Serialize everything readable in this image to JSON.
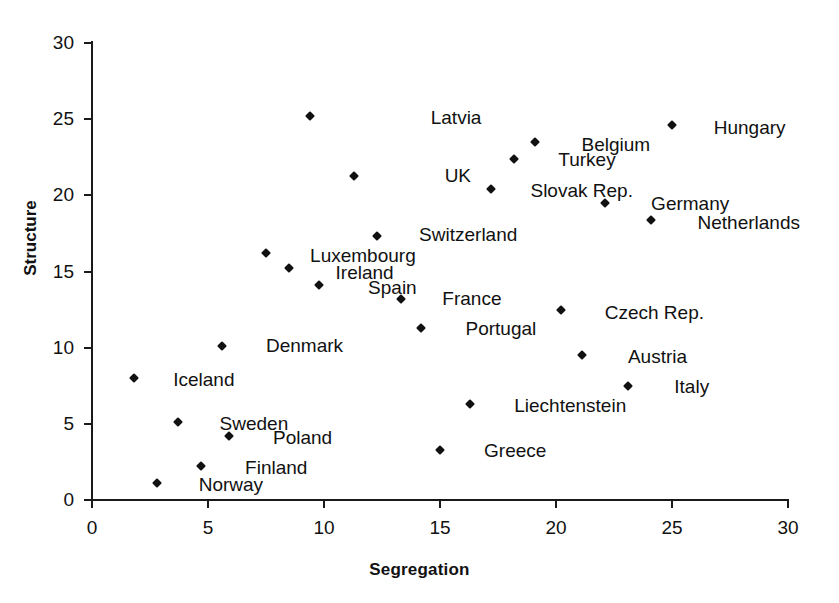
{
  "chart_data": {
    "type": "scatter",
    "title": "",
    "xlabel": "Segregation",
    "ylabel": "Structure",
    "xlim": [
      0,
      30
    ],
    "ylim": [
      0,
      30
    ],
    "xticks": [
      0,
      5,
      10,
      15,
      20,
      25,
      30
    ],
    "yticks": [
      0,
      5,
      10,
      15,
      20,
      25,
      30
    ],
    "grid": false,
    "legend": "none",
    "marker": "diamond",
    "marker_color": "#111111",
    "points": [
      {
        "label": "Latvia",
        "x": 9.4,
        "y": 25.2,
        "lx": 14.6,
        "ly": 25.1
      },
      {
        "label": "Hungary",
        "x": 25.0,
        "y": 24.6,
        "lx": 26.8,
        "ly": 24.4
      },
      {
        "label": "Belgium",
        "x": 19.1,
        "y": 23.5,
        "lx": 21.1,
        "ly": 23.3
      },
      {
        "label": "Turkey",
        "x": 18.2,
        "y": 22.4,
        "lx": 20.1,
        "ly": 22.3
      },
      {
        "label": "UK",
        "x": 11.3,
        "y": 21.3,
        "lx": 15.2,
        "ly": 21.3
      },
      {
        "label": "Slovak Rep.",
        "x": 17.2,
        "y": 20.4,
        "lx": 18.9,
        "ly": 20.3
      },
      {
        "label": "Germany",
        "x": 22.1,
        "y": 19.5,
        "lx": 24.1,
        "ly": 19.4
      },
      {
        "label": "Netherlands",
        "x": 24.1,
        "y": 18.4,
        "lx": 26.1,
        "ly": 18.2
      },
      {
        "label": "Switzerland",
        "x": 12.3,
        "y": 17.3,
        "lx": 14.1,
        "ly": 17.4
      },
      {
        "label": "Luxembourg",
        "x": 7.5,
        "y": 16.2,
        "lx": 9.4,
        "ly": 16.0
      },
      {
        "label": "Ireland",
        "x": 8.5,
        "y": 15.2,
        "lx": 10.5,
        "ly": 14.9
      },
      {
        "label": "Spain",
        "x": 9.8,
        "y": 14.1,
        "lx": 11.9,
        "ly": 13.9
      },
      {
        "label": "France",
        "x": 13.3,
        "y": 13.2,
        "lx": 15.1,
        "ly": 13.2
      },
      {
        "label": "Czech Rep.",
        "x": 20.2,
        "y": 12.5,
        "lx": 22.1,
        "ly": 12.3
      },
      {
        "label": "Portugal",
        "x": 14.2,
        "y": 11.3,
        "lx": 16.1,
        "ly": 11.2
      },
      {
        "label": "Denmark",
        "x": 5.6,
        "y": 10.1,
        "lx": 7.5,
        "ly": 10.1
      },
      {
        "label": "Austria",
        "x": 21.1,
        "y": 9.5,
        "lx": 23.1,
        "ly": 9.4
      },
      {
        "label": "Iceland",
        "x": 1.8,
        "y": 8.0,
        "lx": 3.5,
        "ly": 7.9
      },
      {
        "label": "Italy",
        "x": 23.1,
        "y": 7.5,
        "lx": 25.1,
        "ly": 7.4
      },
      {
        "label": "Liechtenstein",
        "x": 16.3,
        "y": 6.3,
        "lx": 18.2,
        "ly": 6.2
      },
      {
        "label": "Sweden",
        "x": 3.7,
        "y": 5.1,
        "lx": 5.5,
        "ly": 5.0
      },
      {
        "label": "Poland",
        "x": 5.9,
        "y": 4.2,
        "lx": 7.8,
        "ly": 4.1
      },
      {
        "label": "Greece",
        "x": 15.0,
        "y": 3.3,
        "lx": 16.9,
        "ly": 3.2
      },
      {
        "label": "Finland",
        "x": 4.7,
        "y": 2.2,
        "lx": 6.6,
        "ly": 2.1
      },
      {
        "label": "Norway",
        "x": 2.8,
        "y": 1.1,
        "lx": 4.6,
        "ly": 1.0
      }
    ]
  }
}
